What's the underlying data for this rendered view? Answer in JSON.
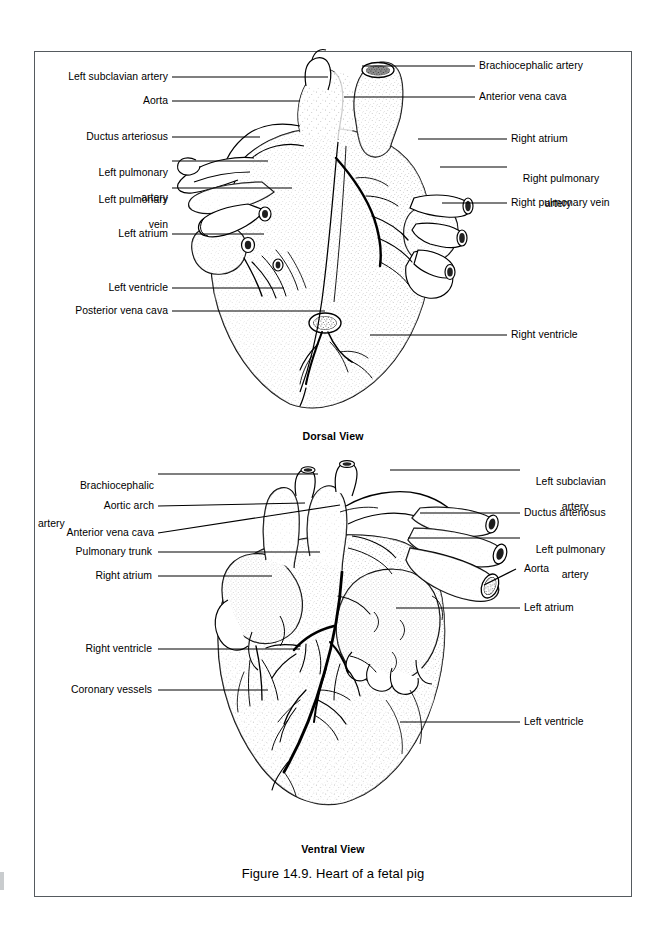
{
  "figure": {
    "caption": "Figure 14.9. Heart of a fetal pig",
    "views": [
      {
        "id": "dorsal",
        "caption": "Dorsal View"
      },
      {
        "id": "ventral",
        "caption": "Ventral View"
      }
    ]
  },
  "dorsal_labels_left": [
    {
      "text": "Left subclavian artery",
      "lines": [
        "Left subclavian artery"
      ]
    },
    {
      "text": "Aorta",
      "lines": [
        "Aorta"
      ]
    },
    {
      "text": "Ductus arteriosus",
      "lines": [
        "Ductus arteriosus"
      ]
    },
    {
      "text": "Left pulmonary artery",
      "lines": [
        "Left pulmonary",
        "artery"
      ]
    },
    {
      "text": "Left pulmonary vein",
      "lines": [
        "Left pulmonary",
        "vein"
      ]
    },
    {
      "text": "Left atrium",
      "lines": [
        "Left atrium"
      ]
    },
    {
      "text": "Left ventricle",
      "lines": [
        "Left ventricle"
      ]
    },
    {
      "text": "Posterior vena cava",
      "lines": [
        "Posterior vena cava"
      ]
    }
  ],
  "dorsal_labels_right": [
    {
      "text": "Brachiocephalic artery",
      "lines": [
        "Brachiocephalic artery"
      ]
    },
    {
      "text": "Anterior vena cava",
      "lines": [
        "Anterior vena cava"
      ]
    },
    {
      "text": "Right atrium",
      "lines": [
        "Right atrium"
      ]
    },
    {
      "text": "Right pulmonary artery",
      "lines": [
        "Right pulmonary",
        "artery"
      ]
    },
    {
      "text": "Right pulmonary vein",
      "lines": [
        "Right pulmonary vein"
      ]
    },
    {
      "text": "Right ventricle",
      "lines": [
        "Right ventricle"
      ]
    }
  ],
  "ventral_labels_left": [
    {
      "text": "Brachiocephalic artery",
      "lines": [
        "Brachiocephalic",
        "artery"
      ]
    },
    {
      "text": "Aortic arch",
      "lines": [
        "Aortic arch"
      ]
    },
    {
      "text": "Anterior vena cava",
      "lines": [
        "Anterior vena cava"
      ]
    },
    {
      "text": "Pulmonary trunk",
      "lines": [
        "Pulmonary trunk"
      ]
    },
    {
      "text": "Right atrium",
      "lines": [
        "Right atrium"
      ]
    },
    {
      "text": "Right ventricle",
      "lines": [
        "Right ventricle"
      ]
    },
    {
      "text": "Coronary vessels",
      "lines": [
        "Coronary vessels"
      ]
    }
  ],
  "ventral_labels_right": [
    {
      "text": "Left subclavian artery",
      "lines": [
        "Left subclavian",
        "artery"
      ]
    },
    {
      "text": "Ductus arteriosus",
      "lines": [
        "Ductus arteriosus"
      ]
    },
    {
      "text": "Left pulmonary artery",
      "lines": [
        "Left pulmonary",
        "artery"
      ]
    },
    {
      "text": "Aorta",
      "lines": [
        "Aorta"
      ]
    },
    {
      "text": "Left atrium",
      "lines": [
        "Left atrium"
      ]
    },
    {
      "text": "Left ventricle",
      "lines": [
        "Left ventricle"
      ]
    }
  ],
  "colors": {
    "ink": "#000000",
    "border": "#555a5e",
    "paper": "#ffffff",
    "stipple": "#3a3a3a"
  }
}
